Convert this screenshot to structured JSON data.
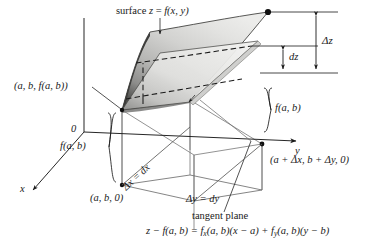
{
  "figure": {
    "background": "#ffffff",
    "ink": "#1a1a1a"
  },
  "colors": {
    "surface_light": "#e8e8e6",
    "surface_mid": "#b9b9b7",
    "surface_dark": "#5a5a58",
    "plane_light": "#f0f0ee",
    "plane_mid": "#d6d6d4",
    "line": "#2b2b2b",
    "thin_line": "#8a8a8a",
    "dot": "#101010"
  },
  "labels": {
    "surface_equation": "surface z = f(x, y)",
    "surface_eq_parts": {
      "word": "surface",
      "z": "z",
      "eq": "=",
      "fn": "f(x, y)"
    },
    "point_on_surface": "(a, b, f(a, b))",
    "origin": "0",
    "delta_z": "Δz",
    "dz": "dz",
    "height_f_ab_right": "f(a, b)",
    "height_f_ab_left": "f(a, b)",
    "axis_x": "x",
    "axis_y": "y",
    "base_point": "(a, b, 0)",
    "far_base_point": "(a + Δx, b + Δy, 0)",
    "delta_x": "Δx = dx",
    "delta_y": "Δy = dy",
    "tangent_plane": "tangent plane",
    "tangent_plane_equation": "z − f(a, b) = f",
    "eq_sub_x": "x",
    "eq_mid": "(a, b)(x − a) + f",
    "eq_sub_y": "y",
    "eq_tail": "(a, b)(y − b)"
  },
  "geometry": {
    "surface_vertices": "left (122,110), top-left (150,32), top-right (268,12), right (268,12) to (190,100)",
    "tangent_plane_vertices": "left (122,110), upper (160,52), right (258,40), lower (190,102)",
    "measure_dot": "(268,12)",
    "axis_origin": "(84,132)"
  }
}
